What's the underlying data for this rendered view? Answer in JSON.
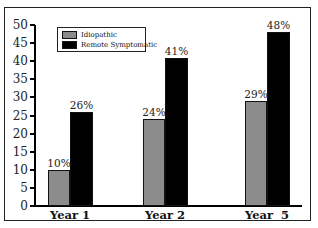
{
  "chart_data": {
    "type": "bar",
    "title": "",
    "xlabel": "",
    "ylabel": "",
    "categories": [
      "Year 1",
      "Year 2",
      "Year  5"
    ],
    "series": [
      {
        "name": "Idiopathic",
        "values": [
          10,
          24,
          29
        ],
        "labels": [
          "10%",
          "24%",
          "29%"
        ],
        "color": "#8c8c8c"
      },
      {
        "name": "Remote Symptomatic",
        "values": [
          26,
          41,
          48
        ],
        "labels": [
          "26%",
          "41%",
          "48%"
        ],
        "color": "#000000"
      }
    ],
    "ylim": [
      0,
      50
    ],
    "yticks": [
      "0",
      "5",
      "10",
      "15",
      "20",
      "25",
      "30",
      "35",
      "40",
      "45",
      "50"
    ],
    "grid": false,
    "legend_position": "top-left"
  }
}
